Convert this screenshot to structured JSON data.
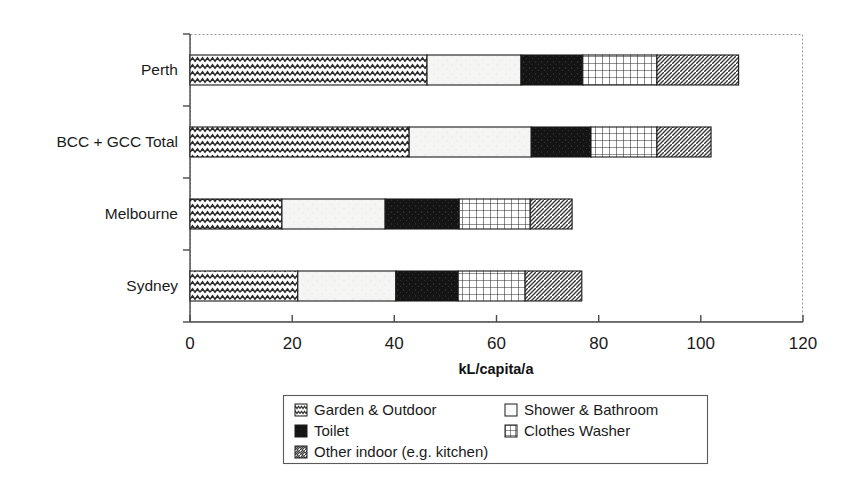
{
  "chart_data": {
    "type": "bar",
    "orientation": "horizontal",
    "stacked": true,
    "title": "",
    "xlabel": "kL/capita/a",
    "ylabel": "",
    "xlim": [
      0,
      120
    ],
    "xticks": [
      0,
      20,
      40,
      60,
      80,
      100,
      120
    ],
    "xtick_labels": [
      "0",
      "20",
      "40",
      "60",
      "80",
      "100",
      "120"
    ],
    "grid": false,
    "legend_position": "bottom",
    "categories": [
      "Sydney",
      "Melbourne",
      "BCC + GCC Total",
      "Perth"
    ],
    "series": [
      {
        "name": "Garden & Outdoor",
        "pattern": "zigzag",
        "values": [
          21.1,
          18.0,
          42.9,
          46.4
        ]
      },
      {
        "name": "Shower & Bathroom",
        "pattern": "light-dots",
        "values": [
          19.2,
          20.2,
          23.9,
          18.4
        ]
      },
      {
        "name": "Toilet",
        "pattern": "solid-dark",
        "values": [
          12.2,
          14.5,
          11.7,
          12.1
        ]
      },
      {
        "name": "Clothes Washer",
        "pattern": "grid",
        "values": [
          13.1,
          13.9,
          12.9,
          14.5
        ]
      },
      {
        "name": "Other indoor (e.g. kitchen)",
        "pattern": "diagonal",
        "values": [
          11.1,
          8.2,
          10.6,
          16.0
        ]
      }
    ],
    "totals": [
      76.7,
      74.8,
      102.0,
      107.3
    ]
  },
  "legend": {
    "entries": [
      {
        "label": "Garden & Outdoor",
        "swatch": "zigzag-swatch"
      },
      {
        "label": "Shower & Bathroom",
        "swatch": "light-dots-swatch"
      },
      {
        "label": "Toilet",
        "swatch": "solid-dark-swatch"
      },
      {
        "label": "Clothes Washer",
        "swatch": "grid-swatch"
      },
      {
        "label": "Other indoor (e.g. kitchen)",
        "swatch": "diagonal-swatch"
      }
    ]
  },
  "colors": {
    "ink": "#1a1a1a",
    "axis": "#4a4a4a",
    "plot_border": "#9a9a9a",
    "toilet_fill": "#1a1a1a",
    "shower_fill": "#f4f4f2",
    "background": "#ffffff"
  }
}
